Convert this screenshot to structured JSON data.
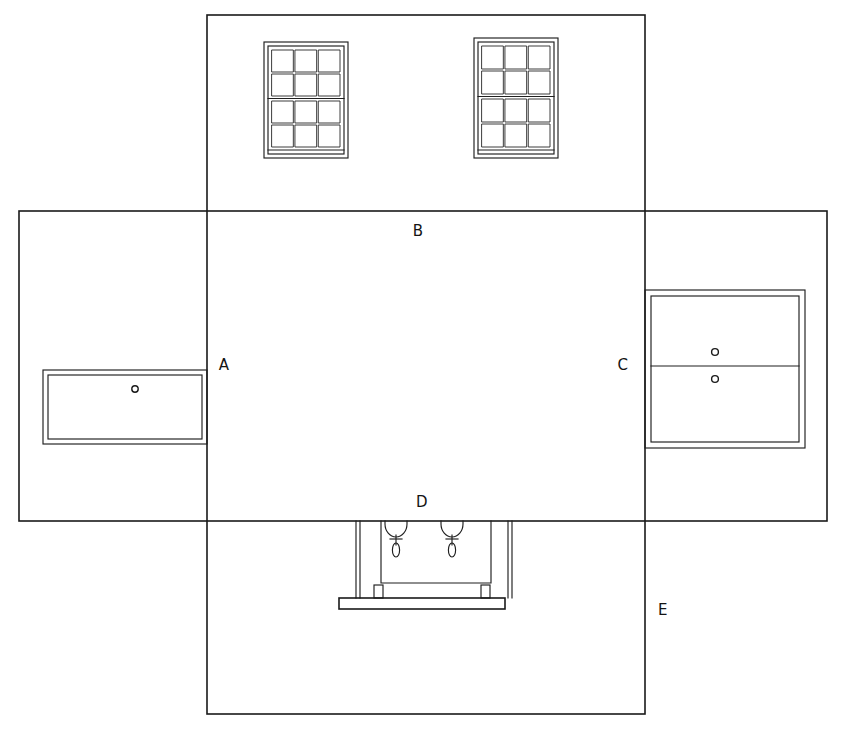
{
  "drawing": {
    "title": "Unfolded box / room elevation development drawing",
    "canvas": {
      "width": 842,
      "height": 730
    },
    "line_color": "#1a1a1a",
    "background_color": "#ffffff",
    "labels": [
      {
        "id": "A",
        "text": "A",
        "x": 224,
        "y": 370,
        "describes": "left-wall elevation panel"
      },
      {
        "id": "B",
        "text": "B",
        "x": 418,
        "y": 236,
        "describes": "upper / rear wall elevation panel"
      },
      {
        "id": "C",
        "text": "C",
        "x": 623,
        "y": 370,
        "describes": "right-wall elevation panel"
      },
      {
        "id": "D",
        "text": "D",
        "x": 422,
        "y": 507,
        "describes": "lower fixture assembly"
      },
      {
        "id": "E",
        "text": "E",
        "x": 663,
        "y": 615,
        "describes": "lower / front wall elevation panel"
      }
    ],
    "panels": [
      {
        "name": "center-vertical-panel",
        "label_ref": "B",
        "x": 207,
        "y": 15,
        "width": 438,
        "height": 699
      },
      {
        "name": "cross-horizontal-panel",
        "x": 19,
        "y": 211,
        "width": 808,
        "height": 310
      }
    ],
    "windows": [
      {
        "name": "window-left",
        "x": 264,
        "y": 42,
        "width": 84,
        "height": 116,
        "columns": 3,
        "rows": 4,
        "sash_divider_after_row": 2
      },
      {
        "name": "window-right",
        "x": 474,
        "y": 38,
        "width": 84,
        "height": 120,
        "columns": 3,
        "rows": 4,
        "sash_divider_after_row": 2
      }
    ],
    "left_cabinet": {
      "name": "left-cabinet-panel",
      "outer": {
        "x": 43,
        "y": 370,
        "width": 164,
        "height": 74
      },
      "inner_inset": 5,
      "knobs": [
        {
          "cx": 135,
          "cy": 389,
          "r": 3.2
        }
      ],
      "dividers": []
    },
    "right_cabinet": {
      "name": "right-cabinet-panel",
      "outer": {
        "x": 645,
        "y": 290,
        "width": 160,
        "height": 158
      },
      "inner_inset": 6,
      "knobs": [
        {
          "cx": 715,
          "cy": 352,
          "r": 3.4
        },
        {
          "cx": 715,
          "cy": 379,
          "r": 3.4
        }
      ],
      "dividers": [
        {
          "y": 366
        }
      ]
    },
    "fixture": {
      "name": "hanging-fixture-assembly",
      "label_ref": "D",
      "frame": {
        "x": 381,
        "y": 521,
        "width": 110,
        "height": 62
      },
      "posts": [
        {
          "x": 356,
          "y": 521,
          "height": 77
        },
        {
          "x": 508,
          "y": 521,
          "height": 77
        }
      ],
      "feet": [
        {
          "x": 374,
          "y": 585,
          "width": 9,
          "height": 13
        },
        {
          "x": 481,
          "y": 585,
          "width": 9,
          "height": 13
        }
      ],
      "base_plate": {
        "x": 339,
        "y": 598,
        "width": 166,
        "height": 11
      },
      "hangers": [
        {
          "name": "hanger-left",
          "cx": 396,
          "bowl_top": 521,
          "bowl_r": 11,
          "stem_bottom": 555
        },
        {
          "name": "hanger-right",
          "cx": 452,
          "bowl_top": 521,
          "bowl_r": 11,
          "stem_bottom": 555
        }
      ]
    }
  }
}
